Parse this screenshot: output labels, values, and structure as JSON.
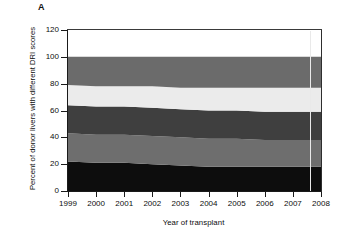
{
  "figure": {
    "panel_letter": "A",
    "ylabel": "Percent of donor livers with different DRI scores",
    "xlabel": "Year of transplant"
  },
  "axes": {
    "y_ticks": [
      0,
      20,
      40,
      60,
      80,
      100,
      120
    ],
    "x_ticks": [
      1999,
      2000,
      2001,
      2002,
      2003,
      2004,
      2005,
      2006,
      2007,
      2008
    ]
  },
  "colors": {
    "band_1": "#0d0d0d",
    "band_2": "#6e6e6e",
    "band_3": "#3f3f3f",
    "band_4": "#ebebeb",
    "band_5": "#6b6b6b",
    "axis": "#1a1a1a",
    "marker_line": "#e9e9e9",
    "background": "#ffffff"
  },
  "chart_data": {
    "type": "area",
    "title": "",
    "subtitle": "",
    "xlabel": "Year of transplant",
    "ylabel": "Percent of donor livers with different DRI scores",
    "xlim": [
      1999,
      2008
    ],
    "ylim": [
      0,
      120
    ],
    "ytick_interval": 20,
    "grid": false,
    "legend": "none",
    "stacked": true,
    "stack_total": 100,
    "annotations": [
      {
        "type": "panel-label",
        "text": "A",
        "position": "top-left"
      },
      {
        "type": "vertical-line",
        "x": 2007.6,
        "color": "#e9e9e9"
      }
    ],
    "x": [
      1999,
      2000,
      2001,
      2002,
      2003,
      2004,
      2005,
      2006,
      2007,
      2008
    ],
    "series": [
      {
        "name": "DRI band 1 (lowest)",
        "color": "#0d0d0d",
        "values": [
          22,
          21,
          21,
          20,
          19,
          18,
          18,
          18,
          18,
          18
        ]
      },
      {
        "name": "DRI band 2",
        "color": "#6e6e6e",
        "values": [
          21,
          21,
          21,
          21,
          21,
          21,
          21,
          20,
          20,
          20
        ]
      },
      {
        "name": "DRI band 3",
        "color": "#3f3f3f",
        "values": [
          21,
          21,
          21,
          21,
          21,
          21,
          21,
          21,
          21,
          21
        ]
      },
      {
        "name": "DRI band 4",
        "color": "#ebebeb",
        "values": [
          15,
          15,
          15,
          16,
          16,
          17,
          17,
          18,
          18,
          18
        ]
      },
      {
        "name": "DRI band 5 (highest)",
        "color": "#6b6b6b",
        "values": [
          21,
          22,
          22,
          22,
          23,
          23,
          23,
          23,
          23,
          23
        ]
      }
    ],
    "cumulative_upper_bounds": {
      "band_1": [
        22,
        21,
        21,
        20,
        19,
        18,
        18,
        18,
        18,
        18
      ],
      "band_2": [
        43,
        42,
        42,
        41,
        40,
        39,
        39,
        38,
        38,
        38
      ],
      "band_3": [
        64,
        63,
        63,
        62,
        61,
        60,
        60,
        59,
        59,
        59
      ],
      "band_4": [
        79,
        78,
        78,
        78,
        77,
        77,
        77,
        77,
        77,
        77
      ],
      "band_5": [
        100,
        100,
        100,
        100,
        100,
        100,
        100,
        100,
        100,
        100
      ]
    }
  }
}
